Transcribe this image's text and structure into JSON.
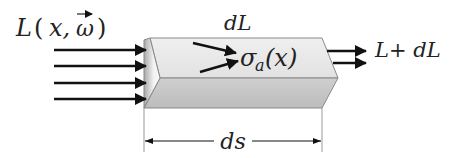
{
  "diagram": {
    "labels": {
      "incoming": "L(x,ω)",
      "incoming_L": "L",
      "incoming_args": "x,",
      "incoming_omega": "ω",
      "top": "dL",
      "sigma": "σ",
      "sigma_sub": "a",
      "sigma_arg": "(x)",
      "outgoing": "L+ dL",
      "length": "ds"
    },
    "colors": {
      "top_face": "#e9e9e9",
      "front_face": "#c4c4c4",
      "end_face_light": "#fafafa",
      "end_face_dark": "#a8a8a8",
      "edge": "#777777",
      "arrow": "#111111"
    },
    "incoming_arrow_count": 4,
    "outgoing_arrow_count": 2,
    "scatter_arrow_count": 2
  }
}
